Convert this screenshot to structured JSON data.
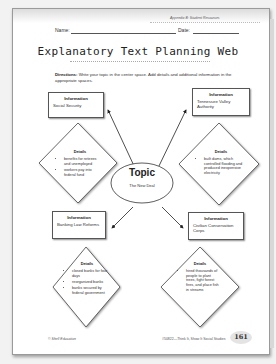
{
  "header": {
    "appendix": "Appendix B: Student Resources",
    "name_label": "Name:",
    "date_label": "Date:"
  },
  "title": "Explanatory Text Planning Web",
  "directions": {
    "bold": "Directions:",
    "text": " Write your topic in the center space.  Add details and additional information in the appropriate spaces."
  },
  "topic": {
    "label": "Topic",
    "value": "The New Deal"
  },
  "branches": [
    {
      "info_label": "Information",
      "info_value": "Social Security",
      "details_label": "Details",
      "details": [
        "benefits for retirees and unemployed",
        "workers pay into federal fund"
      ]
    },
    {
      "info_label": "Information",
      "info_value": "Tennessee Valley Authority",
      "details_label": "Details",
      "details": [
        "built dams, which controlled flooding and produced inexpensive electricity"
      ]
    },
    {
      "info_label": "Information",
      "info_value": "Banking Law Reforms",
      "details_label": "Details",
      "details": [
        "closed banks for four days",
        "reorganized banks",
        "banks secured by federal government"
      ]
    },
    {
      "info_label": "Information",
      "info_value": "Civilian Conservation Corps",
      "details_label": "Details",
      "details": [
        "hired thousands of people to plant trees, fight forest fires, and place fish in streams"
      ]
    }
  ],
  "footer": {
    "publisher": "© Shell Education",
    "series": "#50822—Think It, Show It Social Studies",
    "page_number": "161"
  }
}
